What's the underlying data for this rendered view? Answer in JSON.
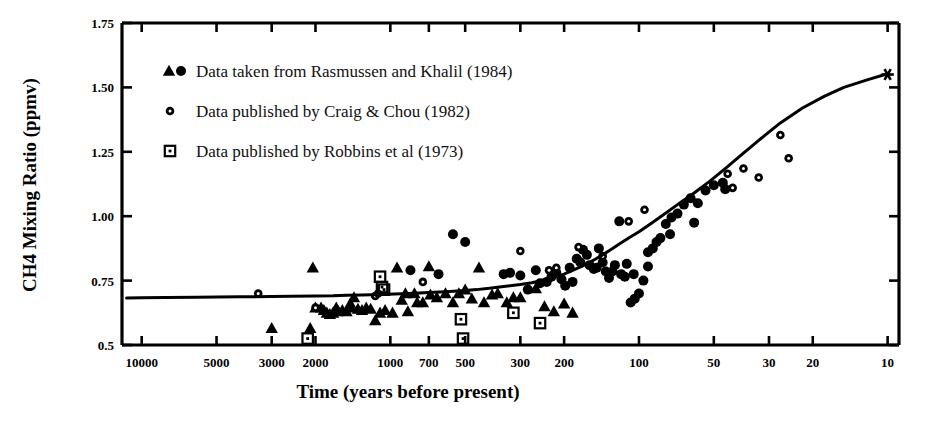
{
  "chart_data": {
    "type": "scatter",
    "title": "",
    "xlabel": "Time (years before present)",
    "ylabel": "CH4 Mixing Ratio (ppmv)",
    "xscale": "log",
    "xreversed": true,
    "xlim": [
      12000,
      9
    ],
    "ylim": [
      0.5,
      1.75
    ],
    "grid": false,
    "xticks": [
      10000,
      5000,
      3000,
      2000,
      1000,
      700,
      500,
      300,
      200,
      100,
      50,
      30,
      20,
      10
    ],
    "xtick_labels": [
      "10000",
      "5000",
      "3000",
      "2000",
      "1000",
      "700",
      "500",
      "300",
      "200",
      "100",
      "50",
      "30",
      "20",
      "10"
    ],
    "yticks": [
      0.5,
      0.75,
      1.0,
      1.25,
      1.5,
      1.75
    ],
    "ytick_labels": [
      "0.5",
      "0.75",
      "1.00",
      "1.25",
      "1.50",
      "1.75"
    ],
    "legend_position": "upper-left",
    "series": [
      {
        "name": "Rasmussen and Khalil (1984)",
        "marker": "filled-triangle",
        "legend_label": "Data taken from Rasmussen and Khalil (1984)",
        "points": [
          [
            3000,
            0.565
          ],
          [
            2100,
            0.565
          ],
          [
            2050,
            0.8
          ],
          [
            2000,
            0.645
          ],
          [
            1900,
            0.645
          ],
          [
            1850,
            0.635
          ],
          [
            1800,
            0.625
          ],
          [
            1750,
            0.62
          ],
          [
            1700,
            0.625
          ],
          [
            1650,
            0.645
          ],
          [
            1620,
            0.63
          ],
          [
            1560,
            0.635
          ],
          [
            1500,
            0.63
          ],
          [
            1450,
            0.66
          ],
          [
            1420,
            0.645
          ],
          [
            1400,
            0.685
          ],
          [
            1350,
            0.64
          ],
          [
            1300,
            0.635
          ],
          [
            1250,
            0.645
          ],
          [
            1200,
            0.64
          ],
          [
            1150,
            0.595
          ],
          [
            1100,
            0.625
          ],
          [
            1050,
            0.635
          ],
          [
            980,
            0.625
          ],
          [
            940,
            0.8
          ],
          [
            900,
            0.675
          ],
          [
            870,
            0.7
          ],
          [
            850,
            0.63
          ],
          [
            800,
            0.7
          ],
          [
            780,
            0.665
          ],
          [
            740,
            0.665
          ],
          [
            700,
            0.805
          ],
          [
            690,
            0.695
          ],
          [
            650,
            0.685
          ],
          [
            600,
            0.7
          ],
          [
            560,
            0.665
          ],
          [
            530,
            0.7
          ],
          [
            500,
            0.715
          ],
          [
            470,
            0.68
          ],
          [
            440,
            0.8
          ],
          [
            420,
            0.665
          ],
          [
            390,
            0.695
          ],
          [
            370,
            0.7
          ],
          [
            340,
            0.665
          ],
          [
            320,
            0.685
          ],
          [
            300,
            0.685
          ],
          [
            260,
            0.72
          ],
          [
            240,
            0.65
          ],
          [
            220,
            0.63
          ],
          [
            200,
            0.66
          ],
          [
            185,
            0.625
          ]
        ]
      },
      {
        "name": "Rasmussen and Khalil (1984) circles",
        "marker": "filled-circle",
        "legend_label": "",
        "points": [
          [
            830,
            0.79
          ],
          [
            640,
            0.775
          ],
          [
            560,
            0.93
          ],
          [
            500,
            0.9
          ],
          [
            350,
            0.775
          ],
          [
            330,
            0.78
          ],
          [
            300,
            0.77
          ],
          [
            280,
            0.715
          ],
          [
            260,
            0.79
          ],
          [
            250,
            0.74
          ],
          [
            235,
            0.745
          ],
          [
            225,
            0.765
          ],
          [
            215,
            0.78
          ],
          [
            205,
            0.755
          ],
          [
            198,
            0.73
          ],
          [
            190,
            0.8
          ],
          [
            185,
            0.745
          ],
          [
            178,
            0.835
          ],
          [
            172,
            0.82
          ],
          [
            168,
            0.87
          ],
          [
            162,
            0.85
          ],
          [
            158,
            0.81
          ],
          [
            152,
            0.795
          ],
          [
            148,
            0.8
          ],
          [
            145,
            0.875
          ],
          [
            140,
            0.82
          ],
          [
            136,
            0.785
          ],
          [
            132,
            0.76
          ],
          [
            128,
            0.785
          ],
          [
            125,
            0.81
          ],
          [
            120,
            0.98
          ],
          [
            118,
            0.775
          ],
          [
            114,
            0.765
          ],
          [
            112,
            0.815
          ],
          [
            108,
            0.665
          ],
          [
            104,
            0.68
          ],
          [
            100,
            0.7
          ],
          [
            96,
            0.75
          ],
          [
            92,
            0.86
          ],
          [
            88,
            0.875
          ],
          [
            85,
            0.9
          ],
          [
            82,
            0.915
          ],
          [
            78,
            0.97
          ],
          [
            74,
            0.995
          ],
          [
            70,
            1.01
          ],
          [
            66,
            1.045
          ],
          [
            62,
            1.07
          ],
          [
            58,
            1.05
          ],
          [
            54,
            1.1
          ],
          [
            50,
            1.12
          ],
          [
            46,
            1.13
          ],
          [
            60,
            0.975
          ],
          [
            45,
            1.105
          ],
          [
            75,
            0.93
          ],
          [
            105,
            0.775
          ],
          [
            92,
            0.805
          ]
        ]
      },
      {
        "name": "Craig & Chou (1982)",
        "marker": "open-circle",
        "legend_label": "Data published by Craig & Chou (1982)",
        "points": [
          [
            3400,
            0.7
          ],
          [
            2000,
            0.645
          ],
          [
            1150,
            0.69
          ],
          [
            1120,
            0.7
          ],
          [
            740,
            0.745
          ],
          [
            300,
            0.865
          ],
          [
            230,
            0.79
          ],
          [
            215,
            0.8
          ],
          [
            175,
            0.88
          ],
          [
            140,
            0.845
          ],
          [
            110,
            0.98
          ],
          [
            95,
            1.025
          ],
          [
            44,
            1.165
          ],
          [
            42,
            1.11
          ],
          [
            38,
            1.185
          ],
          [
            33,
            1.15
          ],
          [
            27,
            1.315
          ],
          [
            25,
            1.225
          ]
        ]
      },
      {
        "name": "Robbins et al (1973)",
        "marker": "dotted-square",
        "legend_label": "Data published by Robbins et al (1973)",
        "points": [
          [
            2150,
            0.525
          ],
          [
            1100,
            0.765
          ],
          [
            1080,
            0.725
          ],
          [
            1060,
            0.715
          ],
          [
            520,
            0.6
          ],
          [
            510,
            0.525
          ],
          [
            320,
            0.625
          ],
          [
            250,
            0.585
          ]
        ]
      },
      {
        "name": "Modern value",
        "marker": "asterisk",
        "legend_label": "",
        "points": [
          [
            10,
            1.55
          ]
        ]
      }
    ],
    "fit_curve": {
      "name": "smoothed fit",
      "points": [
        [
          11500,
          0.682
        ],
        [
          10000,
          0.683
        ],
        [
          8000,
          0.684
        ],
        [
          6000,
          0.685
        ],
        [
          5000,
          0.686
        ],
        [
          4000,
          0.687
        ],
        [
          3000,
          0.688
        ],
        [
          2500,
          0.689
        ],
        [
          2000,
          0.69
        ],
        [
          1700,
          0.691
        ],
        [
          1500,
          0.693
        ],
        [
          1300,
          0.694
        ],
        [
          1100,
          0.696
        ],
        [
          900,
          0.699
        ],
        [
          800,
          0.701
        ],
        [
          700,
          0.704
        ],
        [
          600,
          0.707
        ],
        [
          500,
          0.712
        ],
        [
          450,
          0.715
        ],
        [
          400,
          0.72
        ],
        [
          350,
          0.727
        ],
        [
          300,
          0.735
        ],
        [
          270,
          0.742
        ],
        [
          240,
          0.752
        ],
        [
          220,
          0.762
        ],
        [
          200,
          0.775
        ],
        [
          185,
          0.79
        ],
        [
          170,
          0.805
        ],
        [
          160,
          0.818
        ],
        [
          150,
          0.833
        ],
        [
          140,
          0.85
        ],
        [
          130,
          0.87
        ],
        [
          120,
          0.892
        ],
        [
          110,
          0.915
        ],
        [
          100,
          0.94
        ],
        [
          90,
          0.97
        ],
        [
          80,
          1.005
        ],
        [
          70,
          1.045
        ],
        [
          60,
          1.09
        ],
        [
          52,
          1.135
        ],
        [
          45,
          1.185
        ],
        [
          38,
          1.245
        ],
        [
          32,
          1.305
        ],
        [
          27,
          1.362
        ],
        [
          22,
          1.42
        ],
        [
          18,
          1.465
        ],
        [
          15,
          1.5
        ],
        [
          12,
          1.53
        ],
        [
          10,
          1.553
        ]
      ]
    }
  },
  "legend": {
    "items": [
      {
        "label": "Data taken from Rasmussen and Khalil (1984)",
        "markers": "triangle-circle"
      },
      {
        "label": "Data published by Craig & Chou (1982)",
        "markers": "open-circle"
      },
      {
        "label": "Data published by Robbins et al (1973)",
        "markers": "dotted-square"
      }
    ]
  },
  "axes": {
    "y_title": "CH4 Mixing Ratio (ppmv)",
    "x_title": "Time (years before present)"
  },
  "colors": {
    "ink": "#000000",
    "background": "#ffffff"
  }
}
